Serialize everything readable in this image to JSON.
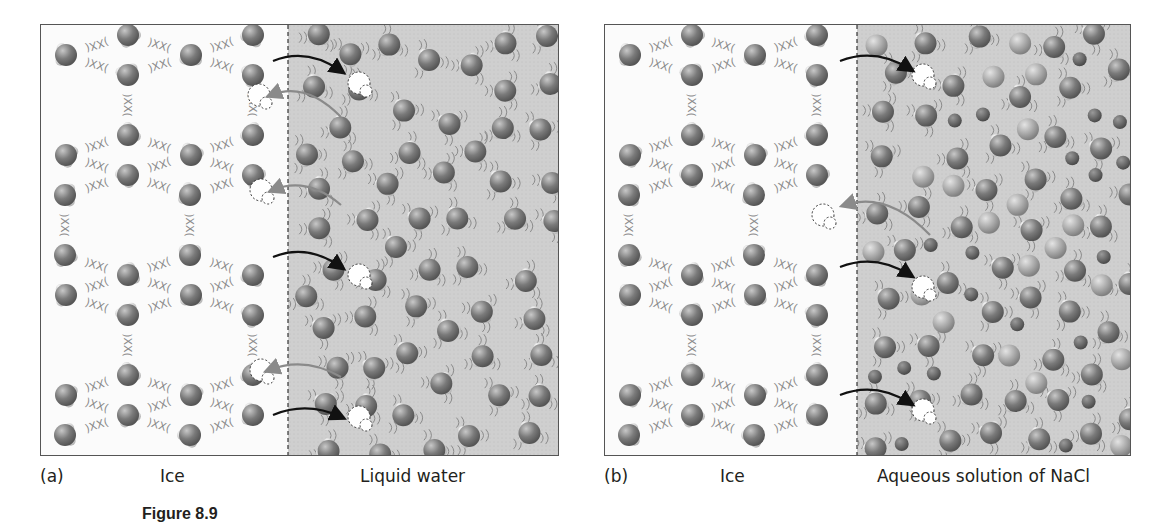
{
  "figure": {
    "caption": "Figure 8.9"
  },
  "panels": [
    {
      "id": "a",
      "tag": "(a)",
      "left_label": "Ice",
      "right_label": "Liquid water",
      "divider_x": 247,
      "width": 519,
      "has_ions": false
    },
    {
      "id": "b",
      "tag": "(b)",
      "left_label": "Ice",
      "right_label": "Aqueous solution of NaCl",
      "divider_x": 252,
      "width": 527,
      "has_ions": true
    }
  ],
  "colors": {
    "ice_bg": "#fbfbfb",
    "liquid_bg": "#cfcfcf",
    "oxygen": "#7a7a7a",
    "hydrogen": "#d8d8d8",
    "na_ion": "#9a9a9a",
    "cl_ion": "#4a4a4a",
    "arrow_melt": "#111111",
    "arrow_freeze": "#8a8a8a",
    "divider": "#333333"
  },
  "legend": {
    "melting_arrow": "black arrow: molecule leaves ice into liquid",
    "freezing_arrow": "gray arrow: molecule joins ice from liquid",
    "vacancy": "dashed outline: vacant lattice site"
  }
}
